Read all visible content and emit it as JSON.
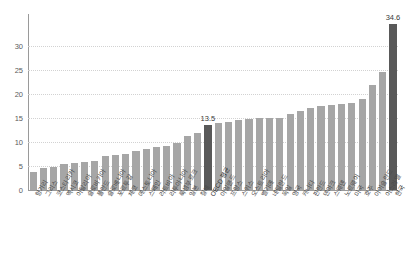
{
  "chart_data": {
    "type": "bar",
    "title": "",
    "subtitle": "",
    "xlabel": "",
    "ylabel": "",
    "ylim": [
      0,
      35
    ],
    "yticks": [
      0,
      5,
      10,
      15,
      20,
      25,
      30
    ],
    "ytick_labels": [
      "0",
      "5",
      "10",
      "15",
      "20",
      "25",
      "30"
    ],
    "grid": true,
    "legend": null,
    "categories": [
      "헝가리",
      "그리스",
      "코스타리카",
      "멕시코",
      "이탈리아",
      "슬로바키아",
      "폴란드",
      "슬로베니아",
      "포르투갈",
      "체코",
      "에스토니아",
      "스페인",
      "라트비아",
      "리투아니아",
      "룩셈부르크",
      "일본",
      "칠레",
      "OECD 평균",
      "아일랜드",
      "프랑스",
      "스위스",
      "오스트리아",
      "벨기에",
      "네덜란드",
      "독일",
      "영국",
      "캐나다",
      "핀란드",
      "덴마크",
      "스웨덴",
      "노르웨이",
      "미국",
      "호주",
      "아이슬란드",
      "이스라엘",
      "한국"
    ],
    "values": [
      3.7,
      4.5,
      4.8,
      5.4,
      5.6,
      5.8,
      6.0,
      7.1,
      7.2,
      7.6,
      8.2,
      8.5,
      9.0,
      9.2,
      9.7,
      11.3,
      11.9,
      13.5,
      13.9,
      14.2,
      14.6,
      14.8,
      14.9,
      15.0,
      15.1,
      15.8,
      16.4,
      17.0,
      17.5,
      17.8,
      18.0,
      18.1,
      19.0,
      21.8,
      24.5,
      34.6
    ],
    "highlight_indices": [
      17,
      35
    ],
    "value_labels": {
      "17": "13.5",
      "35": "34.6"
    },
    "bar_color": "#a6a6a6",
    "highlight_color": "#595959",
    "grid_color": "#d2d2d2",
    "axis_color": "#9a9a9a"
  }
}
